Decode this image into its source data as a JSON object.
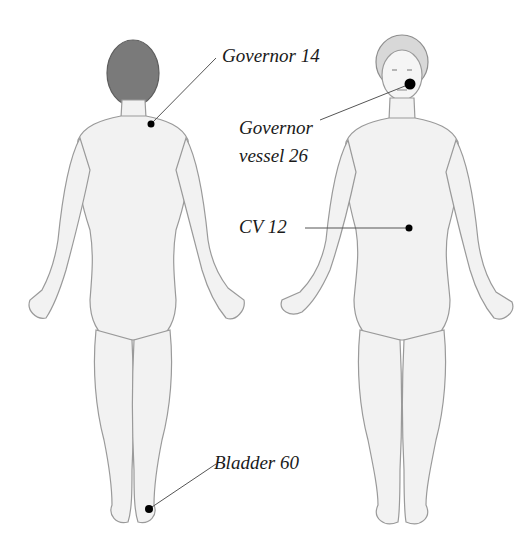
{
  "diagram": {
    "figures": [
      {
        "id": "back-view",
        "view": "posterior"
      },
      {
        "id": "front-view",
        "view": "anterior"
      }
    ],
    "points": [
      {
        "id": "governor-14",
        "label": "Governor 14",
        "figure": "back-view",
        "location": "base of neck",
        "dot": [
          151,
          124
        ]
      },
      {
        "id": "governor-vessel-26",
        "label_line1": "Governor",
        "label_line2": "vessel 26",
        "figure": "front-view",
        "location": "upper lip",
        "dot": [
          410,
          84
        ]
      },
      {
        "id": "cv-12",
        "label": "CV 12",
        "figure": "front-view",
        "location": "upper abdomen",
        "dot": [
          409,
          228
        ]
      },
      {
        "id": "bladder-60",
        "label": "Bladder 60",
        "figure": "back-view",
        "location": "outer ankle",
        "dot": [
          149,
          509
        ]
      }
    ],
    "colors": {
      "background": "#ffffff",
      "dot": "#000000",
      "leader_line": "#555555",
      "label_text": "#1a1a1a",
      "sketch_line": "#9a9a9a",
      "sketch_fill": "#f2f2f2",
      "hair": "#6e6e6e"
    }
  }
}
